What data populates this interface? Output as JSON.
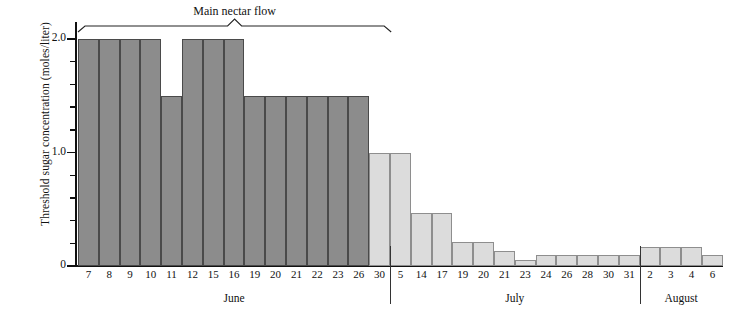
{
  "chart_data": {
    "type": "bar",
    "title": "",
    "annotation": "Main nectar flow",
    "xlabel": "",
    "ylabel": "Threshold sugar concentration (moles/liter)",
    "ylim": [
      0,
      2.15
    ],
    "ytick_labels": [
      "0",
      "1.0",
      "2.0"
    ],
    "ytick_values": [
      0,
      1.0,
      2.0
    ],
    "yminor_values": [
      0.2,
      0.4,
      0.6,
      0.8,
      1.2,
      1.4,
      1.6,
      1.8
    ],
    "grid": false,
    "legend": false,
    "months": [
      {
        "name": "June",
        "start_index": 0,
        "end_index": 14
      },
      {
        "name": "July",
        "start_index": 15,
        "end_index": 26
      },
      {
        "name": "August",
        "start_index": 27,
        "end_index": 30
      }
    ],
    "categories": [
      "7",
      "8",
      "9",
      "10",
      "11",
      "12",
      "15",
      "16",
      "19",
      "20",
      "21",
      "22",
      "23",
      "26",
      "30",
      "5",
      "14",
      "17",
      "19",
      "20",
      "21",
      "23",
      "24",
      "26",
      "28",
      "30",
      "31",
      "2",
      "3",
      "4",
      "6"
    ],
    "values": [
      2.0,
      2.0,
      2.0,
      2.0,
      1.5,
      2.0,
      2.0,
      2.0,
      1.5,
      1.5,
      1.5,
      1.5,
      1.5,
      1.5,
      1.0,
      1.0,
      0.47,
      0.47,
      0.21,
      0.21,
      0.13,
      0.05,
      0.1,
      0.1,
      0.1,
      0.1,
      0.1,
      0.17,
      0.17,
      0.17,
      0.1
    ],
    "bar_shades": [
      "dark",
      "dark",
      "dark",
      "dark",
      "dark",
      "dark",
      "dark",
      "dark",
      "dark",
      "dark",
      "dark",
      "dark",
      "dark",
      "dark",
      "light",
      "light",
      "light",
      "light",
      "light",
      "light",
      "light",
      "light",
      "light",
      "light",
      "light",
      "light",
      "light",
      "light",
      "light",
      "light",
      "light"
    ],
    "colors": {
      "dark_bar": "#8c8c8c",
      "light_bar": "#dcdcdc",
      "dark_bar_edge": "#4a4a4a",
      "light_bar_edge": "#8e8e8e",
      "axis": "#111111",
      "text": "#111111"
    },
    "bracket": {
      "label": "Main nectar flow",
      "start_index": 0,
      "end_index": 13
    }
  }
}
